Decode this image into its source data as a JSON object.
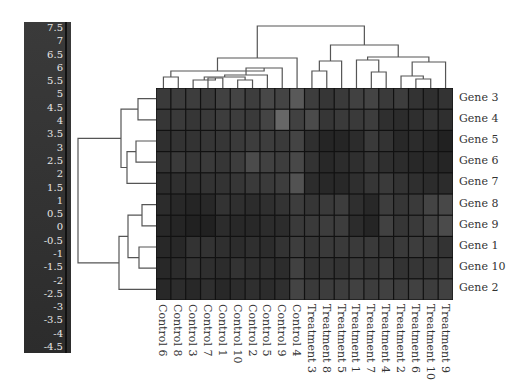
{
  "chart_data": {
    "type": "heatmap",
    "title": "",
    "xlabel": "",
    "ylabel": "",
    "colorbar": {
      "ticks": [
        "7.5",
        "7",
        "6.5",
        "6",
        "5.5",
        "5",
        "4.5",
        "4",
        "3.5",
        "3",
        "2.5",
        "2",
        "1.5",
        "1",
        "0.5",
        "0",
        "-0.5",
        "-1",
        "-1.5",
        "-2",
        "-2.5",
        "-3",
        "-3.5",
        "-4",
        "-4.5"
      ],
      "range": [
        -4.5,
        7.5
      ]
    },
    "columns": [
      "Control 6",
      "Control 8",
      "Control 3",
      "Control 7",
      "Control 1",
      "Control 10",
      "Control 2",
      "Control 5",
      "Control 9",
      "Control 4",
      "Treatment 3",
      "Treatment 8",
      "Treatment 5",
      "Treatment 1",
      "Treatment 7",
      "Treatment 4",
      "Treatment 2",
      "Treatment 6",
      "Treatment 10",
      "Treatment 9"
    ],
    "rows": [
      "Gene 3",
      "Gene 4",
      "Gene 5",
      "Gene 6",
      "Gene 7",
      "Gene 8",
      "Gene 9",
      "Gene 1",
      "Gene 10",
      "Gene 2"
    ],
    "values": [
      [
        1.5,
        1.6,
        1.6,
        1.5,
        1.7,
        1.8,
        1.6,
        1.9,
        1.8,
        2.4,
        1.6,
        1.4,
        1.5,
        1.7,
        1.8,
        1.5,
        1.6,
        1.3,
        1.2,
        1.3
      ],
      [
        1.4,
        1.5,
        1.4,
        1.5,
        1.6,
        1.6,
        1.5,
        1.8,
        2.8,
        1.7,
        2.0,
        1.4,
        1.5,
        1.5,
        1.6,
        1.2,
        1.1,
        1.2,
        1.3,
        1.2
      ],
      [
        1.2,
        1.3,
        1.3,
        1.4,
        1.4,
        1.5,
        1.6,
        1.6,
        1.5,
        1.8,
        1.2,
        0.9,
        0.9,
        1.1,
        1.5,
        1.3,
        1.0,
        1.1,
        1.0,
        0.8
      ],
      [
        1.3,
        1.5,
        1.4,
        1.5,
        1.4,
        1.6,
        2.0,
        1.7,
        1.6,
        1.9,
        1.3,
        1.0,
        1.1,
        1.2,
        1.4,
        1.2,
        1.1,
        1.0,
        1.0,
        0.9
      ],
      [
        1.1,
        1.2,
        1.2,
        1.3,
        1.3,
        1.4,
        1.5,
        1.5,
        1.6,
        2.2,
        1.1,
        1.0,
        1.0,
        1.2,
        1.4,
        1.5,
        1.3,
        1.2,
        1.1,
        1.1
      ],
      [
        1.1,
        1.0,
        0.9,
        1.0,
        1.3,
        1.2,
        1.1,
        1.2,
        1.3,
        1.6,
        1.4,
        1.5,
        1.6,
        1.2,
        1.0,
        1.6,
        1.4,
        1.5,
        1.8,
        1.9
      ],
      [
        1.0,
        0.9,
        0.8,
        0.8,
        1.1,
        1.0,
        1.0,
        1.1,
        1.1,
        1.5,
        1.5,
        1.6,
        1.6,
        1.1,
        0.9,
        1.7,
        1.4,
        1.5,
        1.7,
        2.0
      ],
      [
        1.0,
        1.0,
        1.3,
        1.3,
        1.2,
        1.1,
        1.2,
        1.1,
        1.3,
        1.6,
        1.4,
        1.5,
        1.5,
        1.5,
        1.5,
        1.4,
        1.5,
        1.6,
        1.5,
        1.3
      ],
      [
        1.0,
        1.1,
        1.3,
        1.2,
        1.1,
        1.3,
        1.2,
        1.2,
        1.1,
        1.7,
        1.3,
        1.4,
        1.3,
        1.5,
        1.4,
        1.6,
        1.3,
        1.4,
        1.4,
        1.5
      ],
      [
        1.0,
        1.1,
        1.0,
        1.2,
        1.0,
        1.1,
        1.2,
        1.1,
        1.2,
        1.8,
        1.5,
        1.6,
        1.6,
        1.7,
        1.6,
        1.7,
        1.6,
        1.7,
        1.6,
        1.7
      ]
    ],
    "color_scale": {
      "low": "#1a1a1a",
      "high": "#6e6e6e"
    },
    "row_dendrogram": true,
    "column_dendrogram": true,
    "legend_position": "left"
  }
}
